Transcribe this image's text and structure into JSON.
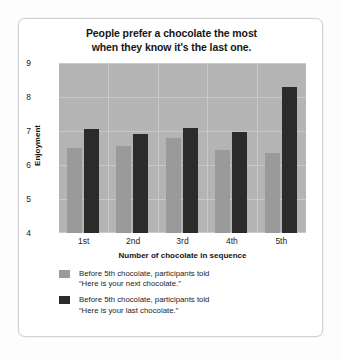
{
  "chart_data": {
    "type": "bar",
    "title": "People prefer a chocolate the most when they know it's the last one.",
    "title_lines": [
      "People prefer a chocolate the most",
      "when they know it's the last one."
    ],
    "xlabel": "Number of chocolate in sequence",
    "ylabel": "Enjoyment",
    "categories": [
      "1st",
      "2nd",
      "3rd",
      "4th",
      "5th"
    ],
    "ylim": [
      4,
      9
    ],
    "yticks": [
      9,
      8,
      7,
      6,
      5,
      4
    ],
    "grid": true,
    "legend_position": "bottom-left",
    "series": [
      {
        "name": "Before 5th chocolate, participants told \"Here is your next chocolate.\"",
        "name_lines": [
          "Before 5th chocolate, participants told",
          "“Here is your next chocolate.”"
        ],
        "color": "#9a9a9a",
        "values": [
          6.5,
          6.55,
          6.8,
          6.45,
          6.35
        ]
      },
      {
        "name": "Before 5th chocolate, participants told \"Here is your last chocolate.\"",
        "name_lines": [
          "Before 5th chocolate, participants told",
          "“Here is your last chocolate.”"
        ],
        "color": "#2b2b2b",
        "values": [
          7.05,
          6.9,
          7.1,
          6.98,
          8.3
        ]
      }
    ],
    "plot_background": "#b4b4b4",
    "gridline_color": "#c9c9c9"
  }
}
